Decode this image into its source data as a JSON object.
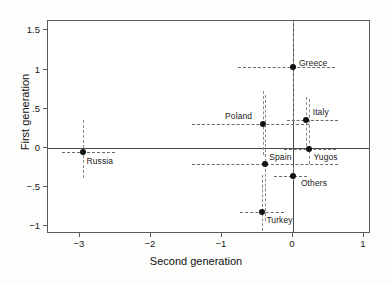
{
  "chart_data": {
    "type": "scatter",
    "title": "",
    "xlabel": "Second generation",
    "ylabel": "First generation",
    "xlim": [
      -3.45,
      1.1
    ],
    "ylim": [
      -1.1,
      1.62
    ],
    "xticks": [
      -3,
      -2,
      -1,
      0,
      1
    ],
    "xticklabels": [
      "−3",
      "−2",
      "−1",
      "0",
      "1"
    ],
    "yticks": [
      1.5,
      1,
      0.5,
      0,
      -0.5,
      -1
    ],
    "yticklabels": [
      "1.5",
      "1",
      ".5",
      "0",
      "−.5",
      "−1"
    ],
    "grid": false,
    "legend": "none",
    "reference_lines": [
      {
        "axis": "y",
        "value": 0
      },
      {
        "axis": "x",
        "value": 0
      }
    ],
    "points": [
      {
        "label": "Greece",
        "x": 0.0,
        "y": 1.03,
        "xerr_low": -0.78,
        "xerr_high": 0.6,
        "yerr_low": 0.37,
        "yerr_high": 1.62,
        "label_dx": 6,
        "label_dy": -9
      },
      {
        "label": "Italy",
        "x": 0.18,
        "y": 0.35,
        "xerr_low": -0.08,
        "xerr_high": 0.63,
        "yerr_low": 0.02,
        "yerr_high": 0.65,
        "label_dx": 7,
        "label_dy": -13
      },
      {
        "label": "Poland",
        "x": -0.42,
        "y": 0.31,
        "xerr_low": -1.42,
        "xerr_high": 0.22,
        "yerr_low": -0.09,
        "yerr_high": 0.72,
        "label_dx": -38,
        "label_dy": -13
      },
      {
        "label": "Yugos",
        "x": 0.22,
        "y": -0.02,
        "xerr_low": -0.12,
        "xerr_high": 0.6,
        "yerr_low": -0.21,
        "yerr_high": 0.62,
        "label_dx": 5,
        "label_dy": 3
      },
      {
        "label": "Spain",
        "x": -0.39,
        "y": -0.21,
        "xerr_low": -1.42,
        "xerr_high": 0.63,
        "yerr_low": -0.93,
        "yerr_high": 0.68,
        "label_dx": 4,
        "label_dy": -12
      },
      {
        "label": "Others",
        "x": 0.0,
        "y": -0.36,
        "xerr_low": -0.27,
        "xerr_high": 0.2,
        "yerr_low": -0.41,
        "yerr_high": -0.25,
        "label_dx": 8,
        "label_dy": 2
      },
      {
        "label": "Turkey",
        "x": -0.43,
        "y": -0.82,
        "xerr_low": -0.74,
        "xerr_high": -0.12,
        "yerr_low": -1.06,
        "yerr_high": -0.35,
        "label_dx": 4,
        "label_dy": 3
      },
      {
        "label": "Russia",
        "x": -2.95,
        "y": -0.05,
        "xerr_low": -3.25,
        "xerr_high": -2.5,
        "yerr_low": -0.38,
        "yerr_high": 0.35,
        "label_dx": 3,
        "label_dy": 4
      }
    ],
    "colors": {
      "point": "#111111",
      "error_bar": "#6b6b6b",
      "reference_line": "#4a4a4a",
      "frame": "#5a5a5a",
      "background": "#ffffff"
    }
  }
}
